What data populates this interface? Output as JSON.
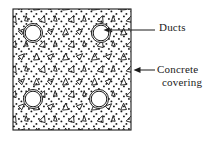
{
  "figure": {
    "colors": {
      "line": "#1a1a1a",
      "fill": "#ffffff",
      "hatch_dot": "#141414",
      "text": "#1a1a1a"
    },
    "slab": {
      "name": "concrete-slab",
      "x": 13,
      "y": 9,
      "width": 118,
      "height": 121,
      "hatch": "concrete-aggregate-dots"
    },
    "ducts": [
      {
        "id": "duct-top-left",
        "cx": 33,
        "cy": 33,
        "r_outer": 9.5,
        "r_inner": 7.8
      },
      {
        "id": "duct-top-right",
        "cx": 101,
        "cy": 33,
        "r_outer": 9.5,
        "r_inner": 7.8
      },
      {
        "id": "duct-bottom-left",
        "cx": 33,
        "cy": 99,
        "r_outer": 9.5,
        "r_inner": 7.8
      },
      {
        "id": "duct-bottom-right",
        "cx": 99,
        "cy": 99,
        "r_outer": 9.5,
        "r_inner": 7.8
      }
    ],
    "callouts": [
      {
        "id": "callout-ducts",
        "label": "Ducts",
        "leader_from_x": 155,
        "leader_to_x": 104,
        "leader_y": 30,
        "arrow_target": "duct-top-right"
      },
      {
        "id": "callout-concrete-covering",
        "label_line_1": "Concrete",
        "label_line_2": "covering",
        "leader_from_x": 155,
        "leader_to_x": 133,
        "leader_y": 70,
        "arrow_target": "concrete-slab-right-edge"
      }
    ]
  },
  "labels": {
    "ducts": "Ducts",
    "concrete_line_1": "Concrete",
    "concrete_line_2": "covering"
  }
}
